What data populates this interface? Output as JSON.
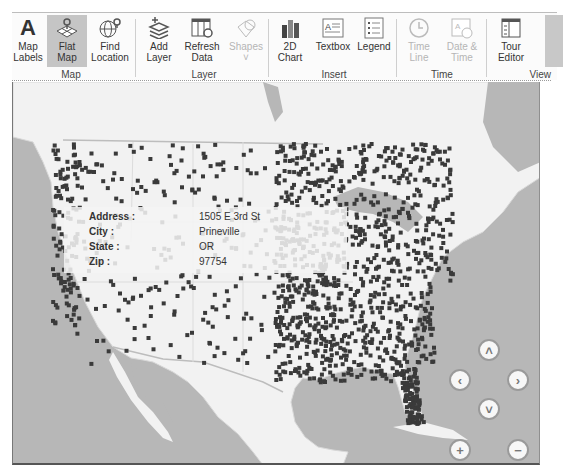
{
  "ribbon": {
    "groups": [
      {
        "label": "Map",
        "buttons": [
          {
            "label": "Map\nLabels",
            "icon": "map-labels-icon",
            "state": "normal"
          },
          {
            "label": "Flat\nMap",
            "icon": "flat-map-icon",
            "state": "active"
          },
          {
            "label": "Find\nLocation",
            "icon": "find-location-icon",
            "state": "normal"
          }
        ]
      },
      {
        "label": "Layer",
        "buttons": [
          {
            "label": "Add\nLayer",
            "icon": "add-layer-icon",
            "state": "normal"
          },
          {
            "label": "Refresh\nData",
            "icon": "refresh-data-icon",
            "state": "normal"
          },
          {
            "label": "Shapes\n˅",
            "icon": "shapes-icon",
            "state": "disabled"
          }
        ]
      },
      {
        "label": "Insert",
        "buttons": [
          {
            "label": "2D\nChart",
            "icon": "chart-2d-icon",
            "state": "normal"
          },
          {
            "label": "Textbox",
            "icon": "textbox-icon",
            "state": "normal"
          },
          {
            "label": "Legend",
            "icon": "legend-icon",
            "state": "normal"
          }
        ]
      },
      {
        "label": "Time",
        "buttons": [
          {
            "label": "Time\nLine",
            "icon": "time-line-icon",
            "state": "disabled"
          },
          {
            "label": "Date &\nTime",
            "icon": "date-time-icon",
            "state": "disabled"
          }
        ]
      },
      {
        "label": "View",
        "buttons": [
          {
            "label": "Tour\nEditor",
            "icon": "tour-editor-icon",
            "state": "normal"
          }
        ]
      }
    ]
  },
  "tooltip": {
    "rows": [
      {
        "key": "Address :",
        "value": "1505 E 3rd St"
      },
      {
        "key": "City :",
        "value": "Prineville"
      },
      {
        "key": "State :",
        "value": "OR"
      },
      {
        "key": "Zip :",
        "value": "97754"
      }
    ]
  },
  "map_controls": {
    "up": "˄",
    "left": "‹",
    "right": "›",
    "down": "˅",
    "zoom_in": "+",
    "zoom_out": "−"
  },
  "colors": {
    "water": "#b7b7b7",
    "land": "#f2f2f2",
    "dots": "#3a3a3a",
    "active_button": "#c5c5c5"
  }
}
